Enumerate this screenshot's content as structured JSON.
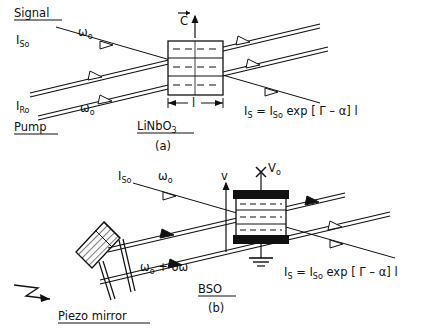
{
  "figure": {
    "caption_a": "(a)",
    "caption_b": "(b)",
    "panels": [
      {
        "id": "a",
        "crystal": "LiNbO3",
        "crystal_display": "LiNbO",
        "crystal_sub": "3",
        "axis_label": "C",
        "axis_note": "c-axis vector arrow pointing up",
        "length_label": "l",
        "input_signal_label": "Signal",
        "input_pump_label": "Pump",
        "signal_intensity": "I",
        "signal_intensity_sub": "So",
        "pump_intensity": "I",
        "pump_intensity_sub": "Ro",
        "freq_signal": "ω",
        "freq_signal_sub": "o",
        "freq_pump": "ω",
        "freq_pump_sub": "o",
        "equation": {
          "lhs": "I",
          "lhs_sub": "S",
          "eq": "=",
          "rhs_i": "I",
          "rhs_sub": "So",
          "exp": "exp",
          "bracket_open": "[",
          "gamma": "Γ",
          "minus": "–",
          "alpha": "α",
          "bracket_close": "]",
          "length": "l"
        }
      },
      {
        "id": "b",
        "crystal": "BSO",
        "voltage_label": "V",
        "voltage_sub": "o",
        "terminal_marker": "×",
        "velocity_label": "v",
        "signal_intensity": "I",
        "signal_intensity_sub": "So",
        "freq_signal": "ω",
        "freq_signal_sub": "o",
        "freq_shifted": "ω",
        "freq_shifted_sub": "o",
        "freq_shifted_rest": "+ δω",
        "mirror_label": "Piezo mirror",
        "ground_note": "ground symbol",
        "equation": {
          "lhs": "I",
          "lhs_sub": "S",
          "eq": "=",
          "rhs_i": "I",
          "rhs_sub": "So",
          "exp": "exp",
          "bracket_open": "[",
          "gamma": "Γ",
          "minus": "–",
          "alpha": "α",
          "bracket_close": "]",
          "length": "l"
        }
      }
    ]
  },
  "colors": {
    "ink": "#111111",
    "paper": "#ffffff"
  }
}
